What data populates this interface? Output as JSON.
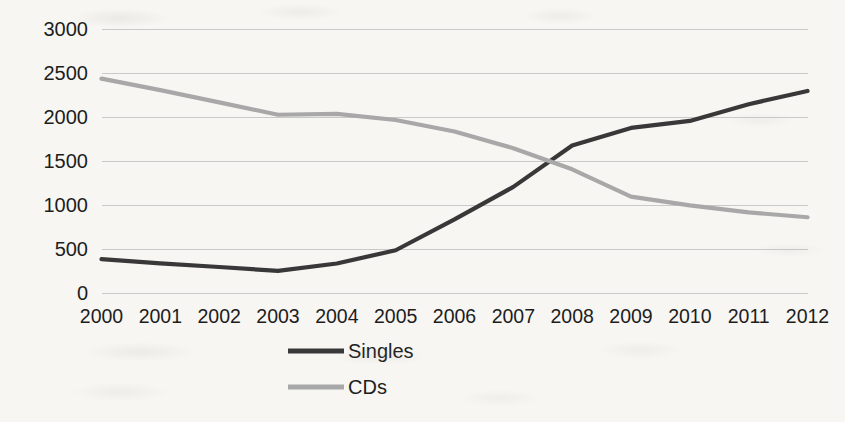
{
  "chart_data": {
    "type": "line",
    "title": "",
    "xlabel": "",
    "ylabel": "",
    "categories": [
      "2000",
      "2001",
      "2002",
      "2003",
      "2004",
      "2005",
      "2006",
      "2007",
      "2008",
      "2009",
      "2010",
      "2011",
      "2012"
    ],
    "x": [
      2000,
      2001,
      2002,
      2003,
      2004,
      2005,
      2006,
      2007,
      2008,
      2009,
      2010,
      2011,
      2012
    ],
    "ylim": [
      0,
      3000
    ],
    "y_ticks": [
      0,
      500,
      1000,
      1500,
      2000,
      2500,
      3000
    ],
    "y_tick_labels": [
      "0",
      "500",
      "1000",
      "1500",
      "2000",
      "2500",
      "3000"
    ],
    "grid": true,
    "legend_position": "bottom",
    "series": [
      {
        "name": "Singles",
        "color": "#383838",
        "values": [
          380,
          330,
          290,
          245,
          330,
          480,
          830,
          1200,
          1670,
          1870,
          1950,
          2140,
          2290
        ]
      },
      {
        "name": "CDs",
        "color": "#a8a8a8",
        "values": [
          2430,
          2300,
          2160,
          2020,
          2030,
          1960,
          1830,
          1640,
          1400,
          1090,
          990,
          910,
          855
        ]
      }
    ]
  },
  "axes": {
    "y_labels": [
      "3000",
      "2500",
      "2000",
      "1500",
      "1000",
      "500",
      "0"
    ],
    "x_labels": [
      "2000",
      "2001",
      "2002",
      "2003",
      "2004",
      "2005",
      "2006",
      "2007",
      "2008",
      "2009",
      "2010",
      "2011",
      "2012"
    ]
  },
  "legend": {
    "items": [
      {
        "label": "Singles",
        "color": "#383838"
      },
      {
        "label": "CDs",
        "color": "#a8a8a8"
      }
    ]
  },
  "style": {
    "background": "#f7f6f3",
    "gridline_color": "#c9c9c9",
    "border_color": "#b4b4b4",
    "text_color": "#1d1d1d"
  }
}
